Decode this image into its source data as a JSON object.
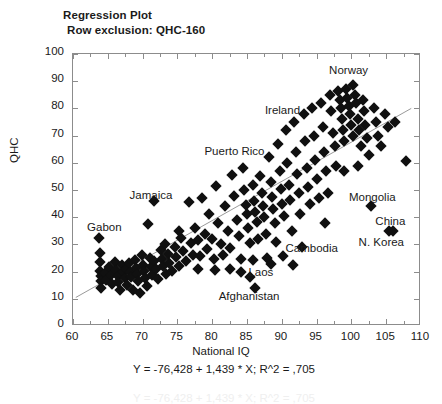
{
  "titles": {
    "line1": "Regression Plot",
    "line2": "Row exclusion: QHC-160"
  },
  "equation_text": "Y = -76,428 + 1,439 * X; R^2 = ,705",
  "chart_data": {
    "type": "scatter",
    "title": "Regression Plot",
    "subtitle": "Row exclusion: QHC-160",
    "xlabel": "National IQ",
    "ylabel": "QHC",
    "xlim": [
      60,
      110
    ],
    "ylim": [
      0,
      100
    ],
    "xticks": [
      60,
      65,
      70,
      75,
      80,
      85,
      90,
      95,
      100,
      105,
      110
    ],
    "yticks": [
      0,
      10,
      20,
      30,
      40,
      50,
      60,
      70,
      80,
      90,
      100
    ],
    "grid": false,
    "legend": "none",
    "marker": "diamond",
    "marker_color": "#101010",
    "regression": {
      "slope": 1.439,
      "intercept": -76.428,
      "r_squared": 0.705,
      "label": "Y = -76,428 + 1,439 * X; R^2 = ,705",
      "color": "#9a9a9a",
      "x_start": 60.4,
      "y_start": 10.5,
      "x_end": 108.6,
      "y_end": 80.0
    },
    "annotations": [
      {
        "text": "Norway",
        "x": 99.6,
        "y": 94.0
      },
      {
        "text": "Ireland",
        "x": 90.1,
        "y": 79.5
      },
      {
        "text": "Puerto Rico",
        "x": 83.2,
        "y": 64.5
      },
      {
        "text": "Jamaica",
        "x": 71.2,
        "y": 48.0
      },
      {
        "text": "Gabon",
        "x": 64.5,
        "y": 36.5
      },
      {
        "text": "Mongolia",
        "x": 103.0,
        "y": 47.5
      },
      {
        "text": "China",
        "x": 105.6,
        "y": 38.5
      },
      {
        "text": "N. Korea",
        "x": 104.3,
        "y": 31.0
      },
      {
        "text": "Cambodia",
        "x": 94.3,
        "y": 28.5
      },
      {
        "text": "Laos",
        "x": 87.0,
        "y": 20.0
      },
      {
        "text": "Afghanistan",
        "x": 85.3,
        "y": 11.0
      }
    ],
    "points": [
      {
        "x": 63.8,
        "y": 32.2
      },
      {
        "x": 63.9,
        "y": 27.0
      },
      {
        "x": 63.9,
        "y": 23.4
      },
      {
        "x": 63.9,
        "y": 20.3
      },
      {
        "x": 64.0,
        "y": 18.3
      },
      {
        "x": 64.0,
        "y": 16.4
      },
      {
        "x": 64.0,
        "y": 14.1
      },
      {
        "x": 64.6,
        "y": 19.5
      },
      {
        "x": 64.8,
        "y": 17.0
      },
      {
        "x": 65.2,
        "y": 21.8
      },
      {
        "x": 65.5,
        "y": 18.6
      },
      {
        "x": 65.6,
        "y": 15.6
      },
      {
        "x": 66.0,
        "y": 23.6
      },
      {
        "x": 66.2,
        "y": 20.6
      },
      {
        "x": 66.4,
        "y": 18.4
      },
      {
        "x": 66.5,
        "y": 16.0
      },
      {
        "x": 66.8,
        "y": 13.2
      },
      {
        "x": 67.1,
        "y": 22.4
      },
      {
        "x": 67.2,
        "y": 19.8
      },
      {
        "x": 67.4,
        "y": 17.6
      },
      {
        "x": 67.6,
        "y": 21.0
      },
      {
        "x": 67.8,
        "y": 15.0
      },
      {
        "x": 68.0,
        "y": 23.2
      },
      {
        "x": 68.2,
        "y": 20.0
      },
      {
        "x": 68.3,
        "y": 18.0
      },
      {
        "x": 68.6,
        "y": 13.4
      },
      {
        "x": 68.9,
        "y": 24.4
      },
      {
        "x": 69.0,
        "y": 21.4
      },
      {
        "x": 69.2,
        "y": 19.0
      },
      {
        "x": 69.4,
        "y": 16.6
      },
      {
        "x": 69.6,
        "y": 12.0
      },
      {
        "x": 69.9,
        "y": 26.0
      },
      {
        "x": 70.0,
        "y": 22.6
      },
      {
        "x": 70.2,
        "y": 20.2
      },
      {
        "x": 70.3,
        "y": 17.8
      },
      {
        "x": 70.6,
        "y": 14.8
      },
      {
        "x": 70.8,
        "y": 37.5
      },
      {
        "x": 71.0,
        "y": 25.0
      },
      {
        "x": 71.2,
        "y": 21.6
      },
      {
        "x": 71.3,
        "y": 18.8
      },
      {
        "x": 71.6,
        "y": 45.8
      },
      {
        "x": 71.7,
        "y": 23.8
      },
      {
        "x": 71.9,
        "y": 20.8
      },
      {
        "x": 72.2,
        "y": 17.2
      },
      {
        "x": 72.6,
        "y": 28.0
      },
      {
        "x": 72.8,
        "y": 24.6
      },
      {
        "x": 73.0,
        "y": 22.0
      },
      {
        "x": 73.3,
        "y": 19.2
      },
      {
        "x": 73.6,
        "y": 26.6
      },
      {
        "x": 73.8,
        "y": 23.0
      },
      {
        "x": 74.2,
        "y": 20.4
      },
      {
        "x": 74.6,
        "y": 29.0
      },
      {
        "x": 74.8,
        "y": 25.4
      },
      {
        "x": 75.2,
        "y": 22.2
      },
      {
        "x": 75.5,
        "y": 32.4
      },
      {
        "x": 75.8,
        "y": 27.4
      },
      {
        "x": 76.2,
        "y": 24.0
      },
      {
        "x": 76.6,
        "y": 45.5
      },
      {
        "x": 76.9,
        "y": 30.6
      },
      {
        "x": 77.2,
        "y": 26.2
      },
      {
        "x": 77.6,
        "y": 36.0
      },
      {
        "x": 78.0,
        "y": 31.6
      },
      {
        "x": 78.2,
        "y": 25.8
      },
      {
        "x": 78.6,
        "y": 47.0
      },
      {
        "x": 78.9,
        "y": 34.0
      },
      {
        "x": 79.2,
        "y": 28.4
      },
      {
        "x": 79.6,
        "y": 41.0
      },
      {
        "x": 79.9,
        "y": 32.0
      },
      {
        "x": 80.2,
        "y": 24.6
      },
      {
        "x": 80.6,
        "y": 51.5
      },
      {
        "x": 80.9,
        "y": 38.0
      },
      {
        "x": 81.2,
        "y": 30.0
      },
      {
        "x": 81.5,
        "y": 26.0
      },
      {
        "x": 81.9,
        "y": 44.0
      },
      {
        "x": 82.2,
        "y": 35.0
      },
      {
        "x": 82.5,
        "y": 28.6
      },
      {
        "x": 82.9,
        "y": 55.6
      },
      {
        "x": 83.2,
        "y": 47.8
      },
      {
        "x": 83.5,
        "y": 39.0
      },
      {
        "x": 83.8,
        "y": 33.0
      },
      {
        "x": 84.1,
        "y": 24.8
      },
      {
        "x": 84.4,
        "y": 58.0
      },
      {
        "x": 84.6,
        "y": 50.0
      },
      {
        "x": 84.8,
        "y": 44.6
      },
      {
        "x": 85.0,
        "y": 41.0
      },
      {
        "x": 85.2,
        "y": 36.0
      },
      {
        "x": 85.4,
        "y": 30.4
      },
      {
        "x": 85.5,
        "y": 18.0
      },
      {
        "x": 85.8,
        "y": 52.0
      },
      {
        "x": 86.0,
        "y": 46.0
      },
      {
        "x": 86.2,
        "y": 42.0
      },
      {
        "x": 86.4,
        "y": 38.4
      },
      {
        "x": 86.6,
        "y": 32.0
      },
      {
        "x": 86.9,
        "y": 55.0
      },
      {
        "x": 87.1,
        "y": 49.0
      },
      {
        "x": 87.3,
        "y": 44.0
      },
      {
        "x": 87.5,
        "y": 40.0
      },
      {
        "x": 87.7,
        "y": 34.0
      },
      {
        "x": 87.9,
        "y": 25.0
      },
      {
        "x": 88.2,
        "y": 62.0
      },
      {
        "x": 88.4,
        "y": 53.0
      },
      {
        "x": 88.6,
        "y": 47.6
      },
      {
        "x": 88.8,
        "y": 43.0
      },
      {
        "x": 89.0,
        "y": 38.0
      },
      {
        "x": 89.2,
        "y": 31.0
      },
      {
        "x": 89.5,
        "y": 67.0
      },
      {
        "x": 89.7,
        "y": 57.0
      },
      {
        "x": 89.9,
        "y": 50.4
      },
      {
        "x": 90.1,
        "y": 45.0
      },
      {
        "x": 90.3,
        "y": 40.4
      },
      {
        "x": 90.6,
        "y": 72.0
      },
      {
        "x": 90.8,
        "y": 60.0
      },
      {
        "x": 91.0,
        "y": 52.0
      },
      {
        "x": 91.2,
        "y": 46.4
      },
      {
        "x": 91.4,
        "y": 35.0
      },
      {
        "x": 91.8,
        "y": 75.0
      },
      {
        "x": 92.0,
        "y": 64.0
      },
      {
        "x": 92.2,
        "y": 56.0
      },
      {
        "x": 92.4,
        "y": 49.0
      },
      {
        "x": 92.6,
        "y": 41.0
      },
      {
        "x": 92.9,
        "y": 29.0
      },
      {
        "x": 93.2,
        "y": 78.0
      },
      {
        "x": 93.4,
        "y": 68.0
      },
      {
        "x": 93.6,
        "y": 58.0
      },
      {
        "x": 93.8,
        "y": 51.0
      },
      {
        "x": 94.0,
        "y": 45.0
      },
      {
        "x": 94.4,
        "y": 80.0
      },
      {
        "x": 94.6,
        "y": 70.0
      },
      {
        "x": 94.8,
        "y": 61.0
      },
      {
        "x": 95.0,
        "y": 54.0
      },
      {
        "x": 95.3,
        "y": 47.0
      },
      {
        "x": 95.7,
        "y": 82.0
      },
      {
        "x": 95.9,
        "y": 73.0
      },
      {
        "x": 96.1,
        "y": 64.0
      },
      {
        "x": 96.4,
        "y": 57.0
      },
      {
        "x": 96.6,
        "y": 49.0
      },
      {
        "x": 96.9,
        "y": 85.0
      },
      {
        "x": 97.1,
        "y": 79.0
      },
      {
        "x": 97.3,
        "y": 71.0
      },
      {
        "x": 97.6,
        "y": 66.0
      },
      {
        "x": 97.8,
        "y": 59.0
      },
      {
        "x": 98.1,
        "y": 86.4
      },
      {
        "x": 98.3,
        "y": 83.0
      },
      {
        "x": 98.5,
        "y": 80.0
      },
      {
        "x": 98.6,
        "y": 76.0
      },
      {
        "x": 98.8,
        "y": 72.0
      },
      {
        "x": 99.0,
        "y": 68.0
      },
      {
        "x": 99.2,
        "y": 87.0
      },
      {
        "x": 99.4,
        "y": 84.0
      },
      {
        "x": 99.6,
        "y": 81.0
      },
      {
        "x": 99.8,
        "y": 78.0
      },
      {
        "x": 100.0,
        "y": 74.0
      },
      {
        "x": 100.2,
        "y": 70.0
      },
      {
        "x": 100.3,
        "y": 88.6
      },
      {
        "x": 100.5,
        "y": 85.0
      },
      {
        "x": 100.7,
        "y": 82.0
      },
      {
        "x": 100.9,
        "y": 76.0
      },
      {
        "x": 101.1,
        "y": 72.0
      },
      {
        "x": 101.4,
        "y": 66.0
      },
      {
        "x": 101.6,
        "y": 83.0
      },
      {
        "x": 101.8,
        "y": 79.0
      },
      {
        "x": 102.0,
        "y": 74.0
      },
      {
        "x": 102.3,
        "y": 69.0
      },
      {
        "x": 102.6,
        "y": 63.0
      },
      {
        "x": 102.8,
        "y": 44.0
      },
      {
        "x": 103.2,
        "y": 80.0
      },
      {
        "x": 103.5,
        "y": 75.0
      },
      {
        "x": 103.8,
        "y": 70.0
      },
      {
        "x": 104.2,
        "y": 66.0
      },
      {
        "x": 104.8,
        "y": 78.0
      },
      {
        "x": 105.2,
        "y": 73.0
      },
      {
        "x": 105.4,
        "y": 35.0
      },
      {
        "x": 106.0,
        "y": 35.0
      },
      {
        "x": 106.2,
        "y": 75.0
      },
      {
        "x": 107.8,
        "y": 60.8
      },
      {
        "x": 86.2,
        "y": 14.0
      },
      {
        "x": 85.8,
        "y": 24.4
      },
      {
        "x": 84.2,
        "y": 20.0
      },
      {
        "x": 82.6,
        "y": 21.0
      },
      {
        "x": 80.4,
        "y": 20.6
      },
      {
        "x": 77.9,
        "y": 20.8
      },
      {
        "x": 90.2,
        "y": 25.6
      },
      {
        "x": 91.6,
        "y": 22.6
      },
      {
        "x": 88.4,
        "y": 22.8
      },
      {
        "x": 75.2,
        "y": 34.8
      },
      {
        "x": 73.2,
        "y": 30.0
      },
      {
        "x": 96.2,
        "y": 38.0
      },
      {
        "x": 99.0,
        "y": 57.0
      },
      {
        "x": 101.0,
        "y": 59.0
      }
    ]
  }
}
